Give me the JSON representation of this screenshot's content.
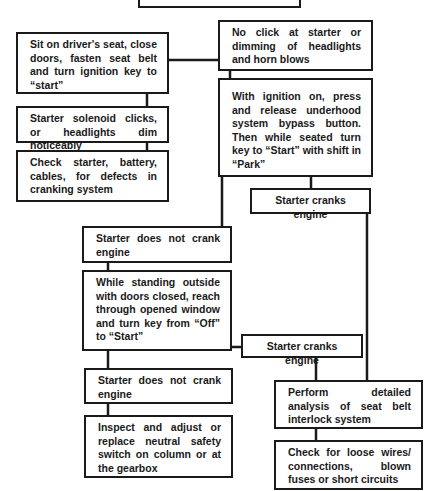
{
  "diagram": {
    "type": "troubleshooting-flowchart",
    "nodes": {
      "top_partial": "",
      "sit_on_seat": "Sit on driver's seat, close doors, fasten seat belt and turn ignition key to “start”",
      "solenoid_clicks": "Starter solenoid clicks, or headlights dim noticeably",
      "check_starter": "Check starter, battery, cables, for defects in cranking system",
      "no_click": "No click at starter or dimming of headlights and horn blows",
      "ignition_bypass": "With ignition on, press and release underhood system bypass button. Then while seated turn key to “Start” with shift in “Park”",
      "cranks_upper": "Starter cranks engine",
      "not_crank_upper": "Starter does not crank engine",
      "standing_outside": "While standing outside with doors closed, reach through opened window and turn key from “Off” to “Start”",
      "cranks_lower": "Starter cranks engine",
      "not_crank_lower": "Starter does not crank engine",
      "inspect_neutral": "Inspect and adjust or replace neutral safety switch on column or at the gearbox",
      "seat_belt_analysis": "Perform detailed analysis of seat belt interlock system",
      "check_wires": "Check for loose wires/ connections, blown fuses or short circuits"
    },
    "edges": [
      [
        "sit_on_seat",
        "solenoid_clicks"
      ],
      [
        "solenoid_clicks",
        "check_starter"
      ],
      [
        "sit_on_seat",
        "no_click"
      ],
      [
        "no_click",
        "ignition_bypass"
      ],
      [
        "ignition_bypass",
        "cranks_upper"
      ],
      [
        "ignition_bypass",
        "not_crank_upper"
      ],
      [
        "not_crank_upper",
        "standing_outside"
      ],
      [
        "standing_outside",
        "cranks_lower"
      ],
      [
        "standing_outside",
        "not_crank_lower"
      ],
      [
        "not_crank_lower",
        "inspect_neutral"
      ],
      [
        "cranks_upper",
        "seat_belt_analysis"
      ],
      [
        "cranks_lower",
        "seat_belt_analysis"
      ],
      [
        "seat_belt_analysis",
        "check_wires"
      ]
    ]
  }
}
